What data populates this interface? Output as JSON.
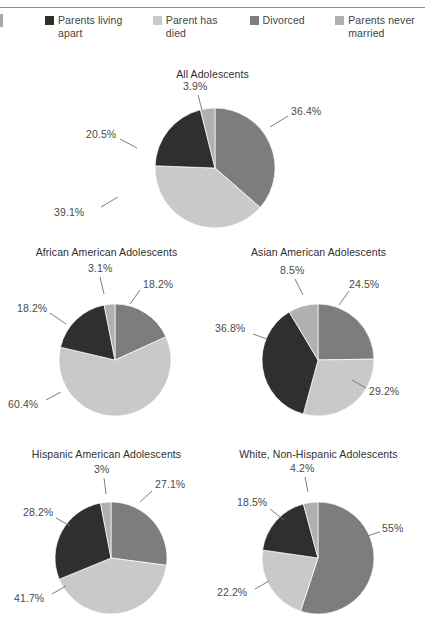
{
  "page": {
    "edge_mark": "",
    "rule": "header-rule"
  },
  "legend": {
    "items": [
      {
        "label": "Parents living apart",
        "color": "#2f2f2f",
        "key": "living_apart"
      },
      {
        "label": "Parent has died",
        "color": "#c9c9c9",
        "key": "parent_died"
      },
      {
        "label": "Divorced",
        "color": "#7d7d7d",
        "key": "divorced"
      },
      {
        "label": "Parents never married",
        "color": "#b0b0b0",
        "key": "never_married"
      }
    ]
  },
  "chart_data": [
    {
      "type": "pie",
      "title": "All Adolescents",
      "categories": [
        "Divorced",
        "Parent has died",
        "Parents living apart",
        "Parents never married"
      ],
      "values": [
        36.4,
        39.1,
        20.5,
        3.9
      ],
      "labels": [
        "36.4%",
        "39.1%",
        "20.5%",
        "3.9%"
      ],
      "colors": [
        "#7d7d7d",
        "#c9c9c9",
        "#2f2f2f",
        "#b0b0b0"
      ],
      "legend_position": "top",
      "grid": false
    },
    {
      "type": "pie",
      "title": "African American Adolescents",
      "categories": [
        "Divorced",
        "Parent has died",
        "Parents living apart",
        "Parents never married"
      ],
      "values": [
        18.2,
        60.4,
        18.2,
        3.1
      ],
      "labels": [
        "18.2%",
        "60.4%",
        "18.2%",
        "3.1%"
      ],
      "colors": [
        "#7d7d7d",
        "#c9c9c9",
        "#2f2f2f",
        "#b0b0b0"
      ],
      "legend_position": "top",
      "grid": false
    },
    {
      "type": "pie",
      "title": "Asian American Adolescents",
      "categories": [
        "Divorced",
        "Parent has died",
        "Parents living apart",
        "Parents never married"
      ],
      "values": [
        24.5,
        29.2,
        36.8,
        8.5
      ],
      "labels": [
        "24.5%",
        "29.2%",
        "36.8%",
        "8.5%"
      ],
      "colors": [
        "#7d7d7d",
        "#c9c9c9",
        "#2f2f2f",
        "#b0b0b0"
      ],
      "legend_position": "top",
      "grid": false
    },
    {
      "type": "pie",
      "title": "Hispanic American Adolescents",
      "categories": [
        "Divorced",
        "Parent has died",
        "Parents living apart",
        "Parents never married"
      ],
      "values": [
        27.1,
        41.7,
        28.2,
        3.0
      ],
      "labels": [
        "27.1%",
        "41.7%",
        "28.2%",
        "3%"
      ],
      "colors": [
        "#7d7d7d",
        "#c9c9c9",
        "#2f2f2f",
        "#b0b0b0"
      ],
      "legend_position": "top",
      "grid": false
    },
    {
      "type": "pie",
      "title": "White, Non-Hispanic Adolescents",
      "categories": [
        "Divorced",
        "Parent has died",
        "Parents living apart",
        "Parents never married"
      ],
      "values": [
        55.0,
        22.2,
        18.5,
        4.2
      ],
      "labels": [
        "55%",
        "22.2%",
        "18.5%",
        "4.2%"
      ],
      "colors": [
        "#7d7d7d",
        "#c9c9c9",
        "#2f2f2f",
        "#b0b0b0"
      ],
      "legend_position": "top",
      "grid": false
    }
  ]
}
